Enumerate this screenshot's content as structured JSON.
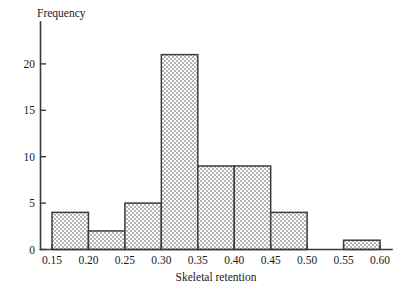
{
  "chart_data": {
    "type": "bar",
    "title": "",
    "xlabel": "Skeletal retention",
    "ylabel": "Frequency",
    "categories": [
      "0.15-0.20",
      "0.20-0.25",
      "0.25-0.30",
      "0.30-0.35",
      "0.35-0.40",
      "0.40-0.45",
      "0.45-0.50",
      "0.50-0.55",
      "0.55-0.60"
    ],
    "bin_edges": [
      0.15,
      0.2,
      0.25,
      0.3,
      0.35,
      0.4,
      0.45,
      0.5,
      0.55,
      0.6
    ],
    "values": [
      4,
      2,
      5,
      21,
      9,
      9,
      4,
      0,
      1
    ],
    "bin_width": 0.05,
    "xlim": [
      0.15,
      0.6
    ],
    "ylim": [
      0,
      21
    ],
    "xticks": [
      0.15,
      0.2,
      0.25,
      0.3,
      0.35,
      0.4,
      0.45,
      0.5,
      0.55,
      0.6
    ],
    "xtick_labels": [
      "0.15",
      "0.20",
      "0.25",
      "0.30",
      "0.35",
      "0.40",
      "0.45",
      "0.50",
      "0.55",
      "0.60"
    ],
    "yticks": [
      0,
      5,
      10,
      15,
      20
    ],
    "ytick_labels": [
      "0",
      "5",
      "10",
      "15",
      "20"
    ],
    "grid": false,
    "legend": false,
    "bar_fill": "#c9c9c9",
    "bar_edge": "#3d3d3d",
    "axis_color": "#3a3a3a",
    "background": "#ffffff",
    "total_count": 55
  }
}
